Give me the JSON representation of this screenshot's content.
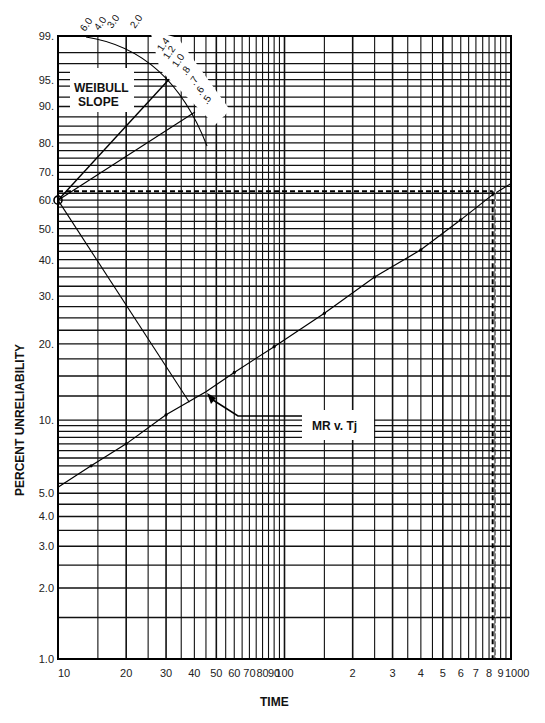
{
  "chart_data": {
    "type": "line",
    "title": "",
    "xlabel": "TIME",
    "ylabel": "PERCENT UNRELIABILITY",
    "x_scale": "log",
    "y_scale": "weibull",
    "xlim": [
      10,
      1000
    ],
    "ylim": [
      1.0,
      99.0
    ],
    "grid": true,
    "x_ticks": [
      "10",
      "20",
      "30",
      "40",
      "50",
      "60",
      "70",
      "80",
      "90",
      "100",
      "2",
      "3",
      "4",
      "5",
      "6",
      "7",
      "8",
      "9",
      "1000"
    ],
    "x_tick_values": [
      10,
      20,
      30,
      40,
      50,
      60,
      70,
      80,
      90,
      100,
      200,
      300,
      400,
      500,
      600,
      700,
      800,
      900,
      1000
    ],
    "y_ticks": [
      "99.",
      "95.",
      "90.",
      "80.",
      "70.",
      "60.",
      "50.",
      "40.",
      "30.",
      "20.",
      "10.",
      "5.0",
      "4.0",
      "3.0",
      "2.0",
      "1.0"
    ],
    "y_tick_values": [
      99,
      95,
      90,
      80,
      70,
      60,
      50,
      40,
      30,
      20,
      10,
      5,
      4,
      3,
      2,
      1
    ],
    "series": [
      {
        "name": "MR v. Tj",
        "x": [
          10,
          14,
          20,
          30,
          45,
          60,
          90,
          150,
          250,
          400,
          600,
          830,
          1000
        ],
        "y": [
          5.3,
          6.5,
          8.0,
          10.5,
          13.0,
          15.5,
          19.5,
          26.0,
          35.0,
          43.0,
          53.0,
          62.0,
          66.0
        ]
      }
    ],
    "estimation_lines": {
      "characteristic_life_percent": 63.2,
      "characteristic_life_time": 830,
      "slope_construction_point": [
        10,
        60.0
      ]
    },
    "annotations": [
      "WEIBULL SLOPE",
      "MR v. Tj"
    ],
    "weibull_slope_scale": [
      "6.0",
      "4.0",
      "3.0",
      "2.0",
      "1.4",
      "1.2",
      "1.0",
      ".8",
      ".7",
      ".6",
      ".5"
    ]
  },
  "labels": {
    "weibull_box_line1": "WEIBULL",
    "weibull_box_line2": "SLOPE",
    "series_label": "MR v. Tj",
    "x_axis_title": "TIME",
    "y_axis_title": "PERCENT UNRELIABILITY"
  }
}
